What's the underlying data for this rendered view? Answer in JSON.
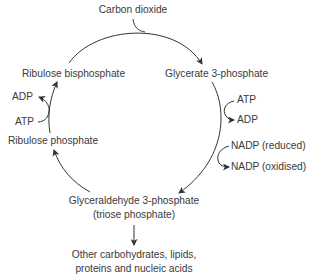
{
  "diagram": {
    "type": "cycle",
    "colors": {
      "text": "#3a3a3a",
      "lines": "#333333",
      "background": "#ffffff"
    },
    "nodes": {
      "carbon_dioxide": "Carbon dioxide",
      "ribulose_bisphosphate": "Ribulose bisphosphate",
      "glycerate_3_phosphate": "Glycerate 3-phosphate",
      "ribulose_phosphate": "Ribulose phosphate",
      "glyceraldehyde_3_phosphate": "Glyceraldehyde 3-phosphate",
      "triose_phosphate": "(triose phosphate)",
      "products_line1": "Other carbohydrates, lipids,",
      "products_line2": "proteins and nucleic acids"
    },
    "cofactors": {
      "left_adp": "ADP",
      "left_atp": "ATP",
      "right_atp": "ATP",
      "right_adp": "ADP",
      "nadp_reduced": "NADP (reduced)",
      "nadp_oxidised": "NADP (oxidised)"
    },
    "edges": [
      {
        "from": "Carbon dioxide",
        "to": "Glycerate 3-phosphate",
        "via": "Ribulose bisphosphate"
      },
      {
        "from": "Glycerate 3-phosphate",
        "to": "Glyceraldehyde 3-phosphate",
        "inputs": [
          "ATP",
          "NADP (reduced)"
        ],
        "outputs": [
          "ADP",
          "NADP (oxidised)"
        ]
      },
      {
        "from": "Glyceraldehyde 3-phosphate",
        "to": "Ribulose phosphate"
      },
      {
        "from": "Ribulose phosphate",
        "to": "Ribulose bisphosphate",
        "inputs": [
          "ATP"
        ],
        "outputs": [
          "ADP"
        ]
      },
      {
        "from": "Glyceraldehyde 3-phosphate",
        "to": "Other carbohydrates, lipids, proteins and nucleic acids"
      }
    ]
  }
}
